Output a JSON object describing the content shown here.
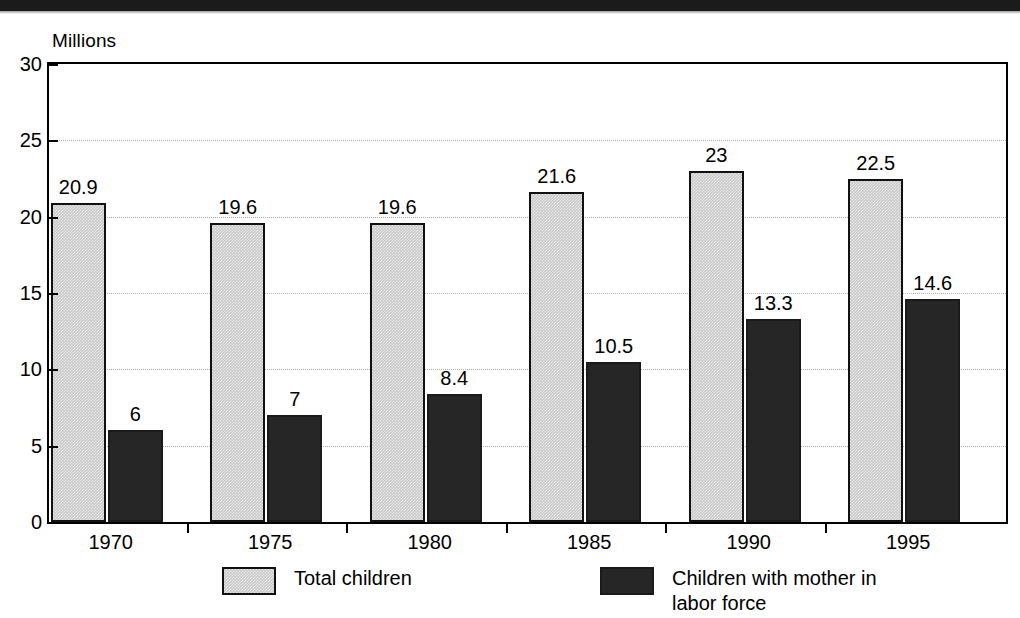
{
  "figure": {
    "y_axis_unit": "Millions",
    "scan_band_color": "#1b1b1b"
  },
  "chart_data": {
    "type": "bar",
    "title": "",
    "subtitle": "",
    "xlabel": "",
    "ylabel": "Millions",
    "ylim": [
      0,
      30
    ],
    "yticks": [
      0,
      5,
      10,
      15,
      20,
      25,
      30
    ],
    "ytick_labels": [
      "0",
      "5",
      "10",
      "15",
      "20",
      "25",
      "30"
    ],
    "grid": true,
    "grid_axis": "y",
    "legend_position": "bottom",
    "categories": [
      "1970",
      "1975",
      "1980",
      "1985",
      "1990",
      "1995"
    ],
    "series": [
      {
        "name": "Total children",
        "color": "#c9c9c9",
        "values": [
          20.9,
          19.6,
          19.6,
          21.6,
          23,
          22.5
        ],
        "labels": [
          "20.9",
          "19.6",
          "19.6",
          "21.6",
          "23",
          "22.5"
        ]
      },
      {
        "name": "Children with mother in labor force",
        "color": "#262626",
        "values": [
          6,
          7,
          8.4,
          10.5,
          13.3,
          14.6
        ],
        "labels": [
          "6",
          "7",
          "8.4",
          "10.5",
          "13.3",
          "14.6"
        ]
      }
    ]
  },
  "legend": {
    "entries": [
      {
        "label_line1": "Total children",
        "label_line2": ""
      },
      {
        "label_line1": "Children with mother in",
        "label_line2": "labor force"
      }
    ]
  }
}
